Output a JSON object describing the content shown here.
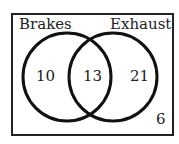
{
  "diagram": {
    "type": "venn",
    "sets": [
      {
        "name": "Brakes",
        "only": "10"
      },
      {
        "name": "Exhaust",
        "only": "21"
      }
    ],
    "intersection": "13",
    "outside": "6"
  }
}
